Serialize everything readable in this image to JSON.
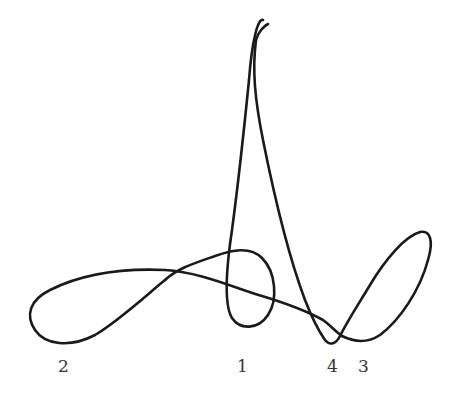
{
  "diagram": {
    "stroke_color": "#1a1a1a",
    "label_color": "#333333",
    "labels": [
      {
        "text": "2",
        "x": 58,
        "y": 358
      },
      {
        "text": "1",
        "x": 237,
        "y": 358
      },
      {
        "text": "4",
        "x": 327,
        "y": 358
      },
      {
        "text": "3",
        "x": 358,
        "y": 358
      }
    ],
    "segments": {
      "top_hook": "M 263 20 C 258 18, 252 40, 249 80 C 246 110, 240 170, 232 230 C 226 270, 224 305, 232 318 C 240 330, 258 330, 268 315 C 278 300, 276 272, 262 258 C 250 246, 232 250, 215 256 C 195 263, 178 268, 165 280",
      "left_loop": "M 165 280 C 150 292, 120 320, 95 335 C 70 348, 45 345, 35 330 C 25 315, 30 300, 50 290 C 80 275, 120 268, 165 270 C 200 272, 235 288, 262 296 C 285 303, 305 310, 323 320 C 330 325, 336 332, 342 336",
      "right_loop": "M 342 336 C 350 340, 365 345, 380 335 C 400 320, 420 290, 428 260 C 434 240, 430 230, 420 232 C 405 236, 385 260, 370 285 C 358 305, 348 320, 340 336 C 336 344, 330 346, 325 340 C 318 330, 312 318, 305 300 C 290 260, 275 200, 263 140 C 255 100, 252 70, 256 40 C 258 32, 264 26, 268 24"
    }
  }
}
